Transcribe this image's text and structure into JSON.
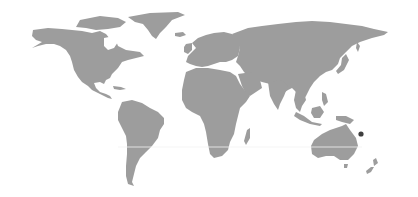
{
  "map": {
    "type": "world-map",
    "projection": "equirectangular-like",
    "background_color": "#ffffff",
    "land_color": "#9d9d9d",
    "labels": [],
    "reference_lines": [
      {
        "name": "tropic-of-capricorn",
        "y": 147,
        "color": "#f2f2f2"
      }
    ],
    "markers": [
      {
        "name": "location-marker",
        "region": "Vanuatu / New Caledonia (South Pacific)",
        "x": 361,
        "y": 134,
        "radius": 2.6,
        "color": "#3f3f3f"
      }
    ]
  }
}
